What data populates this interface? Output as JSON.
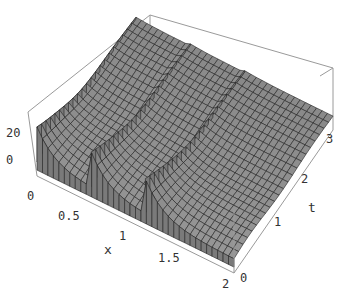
{
  "chart_data": {
    "type": "surface3d",
    "title": "",
    "xlabel": "x",
    "ylabel": "t",
    "zlabel": "",
    "x_ticks": [
      "0",
      "0.5",
      "1",
      "1.5",
      "2"
    ],
    "t_ticks": [
      "0",
      "1",
      "2",
      "3"
    ],
    "z_ticks": [
      "0",
      "20"
    ],
    "xlim": [
      0,
      2
    ],
    "tlim": [
      0,
      3.2
    ],
    "zlim": [
      -5,
      30
    ],
    "ridges": [
      {
        "x": 0.0,
        "peak_z": 25
      },
      {
        "x": 0.55,
        "peak_z": 25
      },
      {
        "x": 1.1,
        "peak_z": 25
      }
    ],
    "surface_color": "#8a8a8a",
    "mesh_color": "#222222",
    "grid": false,
    "legend": null
  },
  "labels": {
    "x_axis": "x",
    "t_axis": "t",
    "x_ticks": [
      {
        "text": "0",
        "x": 27,
        "y": 200
      },
      {
        "text": "0.5",
        "x": 58,
        "y": 220
      },
      {
        "text": "1",
        "x": 119,
        "y": 240
      },
      {
        "text": "1.5",
        "x": 158,
        "y": 262
      },
      {
        "text": "2",
        "x": 222,
        "y": 288
      }
    ],
    "t_ticks": [
      {
        "text": "0",
        "x": 240,
        "y": 282
      },
      {
        "text": "1",
        "x": 274,
        "y": 226
      },
      {
        "text": "2",
        "x": 301,
        "y": 183
      },
      {
        "text": "3",
        "x": 326,
        "y": 143
      }
    ],
    "z_ticks": [
      {
        "text": "20",
        "x": 6,
        "y": 137
      },
      {
        "text": "0",
        "x": 6,
        "y": 164
      }
    ]
  }
}
